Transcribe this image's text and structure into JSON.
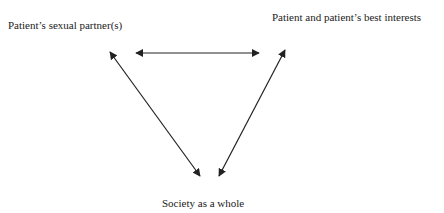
{
  "diagram": {
    "nodes": [
      {
        "id": "partner",
        "label": "Patient’s sexual partner(s)"
      },
      {
        "id": "patient",
        "label": "Patient and patient’s best interests"
      },
      {
        "id": "society",
        "label": "Society as a whole"
      }
    ],
    "edges": [
      {
        "from": "partner",
        "to": "patient",
        "direction": "both"
      },
      {
        "from": "partner",
        "to": "society",
        "direction": "both"
      },
      {
        "from": "patient",
        "to": "society",
        "direction": "both"
      }
    ],
    "colors": {
      "arrow": "#222222",
      "text": "#222222",
      "background": "#ffffff"
    }
  }
}
